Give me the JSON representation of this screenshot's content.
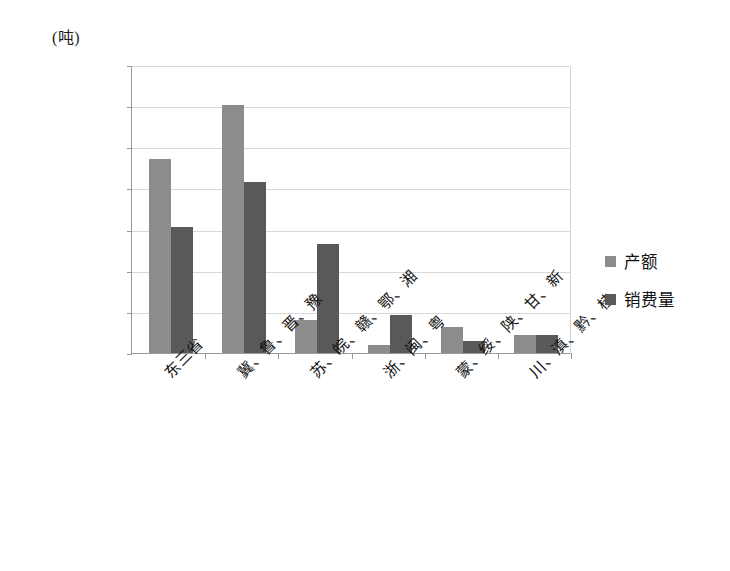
{
  "chart_data": {
    "type": "bar",
    "title": "(吨)",
    "xlabel": "",
    "ylabel": "(吨)",
    "ylim": [
      0,
      14000000
    ],
    "ytick_step": 2000000,
    "grid": true,
    "legend_position": "right",
    "categories": [
      "东三省",
      "冀、鲁、晋、豫",
      "苏、皖、赣、鄂、湘",
      "浙、闽、粤",
      "蒙、绥、陕、甘、新",
      "川、滇、黔、桂"
    ],
    "ytick_labels": [
      "14000000",
      "12000000",
      "10000000",
      "8000000",
      "6000000",
      "4000000",
      "2000000",
      "0"
    ],
    "ytick_values": [
      14000000,
      12000000,
      10000000,
      8000000,
      6000000,
      4000000,
      2000000,
      0
    ],
    "series": [
      {
        "name": "产额",
        "color": "#8c8c8c",
        "values": [
          9450000,
          12050000,
          1600000,
          400000,
          1250000,
          900000
        ]
      },
      {
        "name": "销费量",
        "color": "#595959",
        "values": [
          6150000,
          8300000,
          5300000,
          1850000,
          600000,
          900000
        ]
      }
    ]
  },
  "legend": {
    "items": [
      {
        "label": "产额",
        "color": "#8c8c8c"
      },
      {
        "label": "销费量",
        "color": "#595959"
      }
    ]
  },
  "colors": {
    "produce": "#8c8c8c",
    "consume": "#595959",
    "axis": "#9a9a9a",
    "grid": "#d8d8d8",
    "text": "#111111",
    "background": "#ffffff"
  }
}
